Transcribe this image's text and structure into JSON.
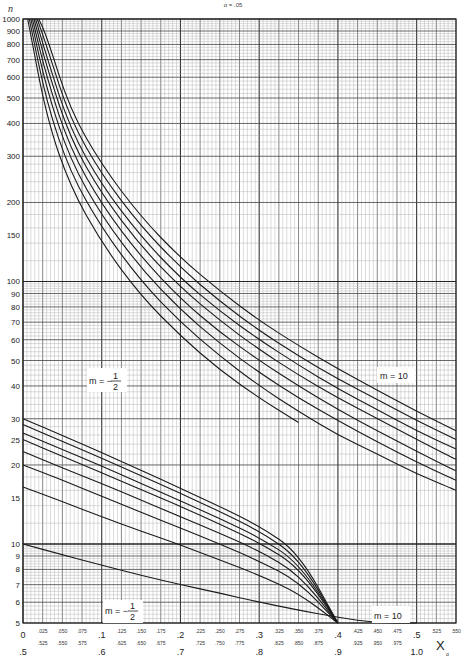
{
  "chart_data": {
    "type": "line",
    "title": "α = .05",
    "xlabel": "X_α",
    "ylabel": "n",
    "x_scale": "linear",
    "y_scale": "log",
    "xlim": [
      0,
      0.55
    ],
    "ylim": [
      5,
      1000
    ],
    "grid": true,
    "x_ticks_primary": [
      "0",
      ".025",
      ".050",
      ".075",
      ".1",
      ".125",
      ".150",
      ".175",
      ".2",
      ".225",
      ".250",
      ".275",
      ".3",
      ".325",
      ".350",
      ".375",
      ".4",
      ".425",
      ".450",
      ".475",
      ".5",
      ".525",
      ".550"
    ],
    "x_ticks_secondary": [
      ".5",
      ".525",
      ".550",
      ".575",
      ".6",
      ".625",
      ".650",
      ".675",
      ".7",
      ".725",
      ".750",
      ".775",
      ".8",
      ".825",
      ".850",
      ".875",
      ".9",
      ".925",
      ".950",
      ".975",
      "1.0"
    ],
    "y_ticks": [
      "5",
      "6",
      "7",
      "8",
      "9",
      "10",
      "15",
      "20",
      "25",
      "30",
      "40",
      "50",
      "60",
      "70",
      "80",
      "90",
      "100",
      "150",
      "200",
      "300",
      "400",
      "500",
      "600",
      "700",
      "800",
      "900",
      "1000"
    ],
    "annotations": [
      {
        "text": "m = -1/2",
        "position": "upper family, left"
      },
      {
        "text": "m = 10",
        "position": "upper family, right"
      },
      {
        "text": "m = -1/2",
        "position": "lower family, bottom-left"
      },
      {
        "text": "m = 10",
        "position": "lower family, bottom-right"
      }
    ],
    "families": [
      {
        "name": "upper (x scale 0–.55)",
        "series": [
          {
            "name": "m = -1/2",
            "x": [
              0.006,
              0.03,
              0.06,
              0.1,
              0.15,
              0.2,
              0.25,
              0.3,
              0.35
            ],
            "y": [
              1000,
              420,
              230,
              140,
              88,
              62,
              46,
              36,
              29
            ]
          },
          {
            "name": "m = 0",
            "x": [
              0.008,
              0.03,
              0.06,
              0.1,
              0.15,
              0.2,
              0.25,
              0.3,
              0.35,
              0.4,
              0.45,
              0.5,
              0.55
            ],
            "y": [
              1000,
              480,
              260,
              160,
              100,
              70,
              52,
              40,
              32,
              26,
              22,
              18.5,
              16
            ]
          },
          {
            "name": "m = 1/2",
            "x": [
              0.01,
              0.03,
              0.06,
              0.1,
              0.15,
              0.2,
              0.25,
              0.3,
              0.35,
              0.4,
              0.45,
              0.5,
              0.55
            ],
            "y": [
              1000,
              540,
              290,
              178,
              112,
              78,
              58,
              45,
              36,
              29.5,
              24.5,
              20.5,
              17.5
            ]
          },
          {
            "name": "m = 1",
            "x": [
              0.012,
              0.03,
              0.06,
              0.1,
              0.15,
              0.2,
              0.25,
              0.3,
              0.35,
              0.4,
              0.45,
              0.5,
              0.55
            ],
            "y": [
              1000,
              600,
              320,
              196,
              124,
              86,
              64,
              50,
              40,
              32.5,
              27,
              22.5,
              19
            ]
          },
          {
            "name": "m = 2",
            "x": [
              0.014,
              0.03,
              0.06,
              0.1,
              0.15,
              0.2,
              0.25,
              0.3,
              0.35,
              0.4,
              0.45,
              0.5,
              0.55
            ],
            "y": [
              1000,
              660,
              350,
              215,
              136,
              95,
              71,
              55,
              44,
              36,
              30,
              25,
              21
            ]
          },
          {
            "name": "m = 3",
            "x": [
              0.016,
              0.03,
              0.06,
              0.1,
              0.15,
              0.2,
              0.25,
              0.3,
              0.35,
              0.4,
              0.45,
              0.5,
              0.55
            ],
            "y": [
              1000,
              720,
              380,
              233,
              148,
              103,
              77,
              60,
              48,
              39,
              32.5,
              27,
              23
            ]
          },
          {
            "name": "m = 5",
            "x": [
              0.018,
              0.03,
              0.06,
              0.1,
              0.15,
              0.2,
              0.25,
              0.3,
              0.35,
              0.4,
              0.45,
              0.5,
              0.55
            ],
            "y": [
              1000,
              790,
              415,
              255,
              162,
              113,
              84,
              65,
              52,
              42.5,
              35.5,
              29.5,
              25
            ]
          },
          {
            "name": "m = 10",
            "x": [
              0.02,
              0.03,
              0.06,
              0.1,
              0.15,
              0.2,
              0.25,
              0.3,
              0.35,
              0.4,
              0.45,
              0.5,
              0.55
            ],
            "y": [
              1000,
              860,
              450,
              278,
              176,
              123,
              92,
              71,
              57,
              46.5,
              38.5,
              32,
              27
            ]
          }
        ]
      },
      {
        "name": "lower (x scale .5–1.0)",
        "series": [
          {
            "name": "m = -1/2",
            "x": [
              0.5,
              0.55,
              0.6,
              0.65,
              0.7,
              0.75,
              0.8,
              0.85,
              0.9,
              0.95,
              1.0
            ],
            "y": [
              10,
              9.1,
              8.3,
              7.6,
              7.0,
              6.5,
              6.0,
              5.6,
              5.25,
              5.0,
              5.0
            ]
          },
          {
            "name": "m = 0",
            "x": [
              0.5,
              0.55,
              0.6,
              0.65,
              0.7,
              0.75,
              0.8,
              0.85,
              0.9
            ],
            "y": [
              16.5,
              14.5,
              12.7,
              11.2,
              9.9,
              8.7,
              7.6,
              6.5,
              5.0
            ]
          },
          {
            "name": "m = 1/2",
            "x": [
              0.5,
              0.55,
              0.6,
              0.65,
              0.7,
              0.75,
              0.8,
              0.85,
              0.9
            ],
            "y": [
              20,
              17.5,
              15.2,
              13.2,
              11.5,
              10,
              8.6,
              7.2,
              5.0
            ]
          },
          {
            "name": "m = 1",
            "x": [
              0.5,
              0.55,
              0.6,
              0.65,
              0.7,
              0.75,
              0.8,
              0.85,
              0.9
            ],
            "y": [
              22.5,
              19.5,
              17,
              14.7,
              12.7,
              11,
              9.4,
              7.7,
              5.0
            ]
          },
          {
            "name": "m = 2",
            "x": [
              0.5,
              0.55,
              0.6,
              0.65,
              0.7,
              0.75,
              0.8,
              0.85,
              0.9
            ],
            "y": [
              25,
              21.6,
              18.7,
              16.1,
              13.9,
              11.9,
              10.1,
              8.2,
              5.0
            ]
          },
          {
            "name": "m = 3",
            "x": [
              0.5,
              0.55,
              0.6,
              0.65,
              0.7,
              0.75,
              0.8,
              0.85,
              0.9
            ],
            "y": [
              26.5,
              22.9,
              19.8,
              17,
              14.6,
              12.5,
              10.6,
              8.5,
              5.0
            ]
          },
          {
            "name": "m = 5",
            "x": [
              0.5,
              0.55,
              0.6,
              0.65,
              0.7,
              0.75,
              0.8,
              0.85,
              0.9
            ],
            "y": [
              28.5,
              24.6,
              21.2,
              18.2,
              15.6,
              13.3,
              11.2,
              8.9,
              5.0
            ]
          },
          {
            "name": "m = 10",
            "x": [
              0.5,
              0.55,
              0.6,
              0.65,
              0.7,
              0.75,
              0.8,
              0.85,
              0.9
            ],
            "y": [
              30,
              25.9,
              22.3,
              19.1,
              16.3,
              13.9,
              11.7,
              9.3,
              5.0
            ]
          }
        ]
      }
    ]
  },
  "labels": {
    "title": "α = .05",
    "ylabel": "n",
    "xlabel": "X",
    "xlabel_sub": "α",
    "m_upper_left": "m = −",
    "m_upper_right": "m = 10",
    "m_lower_left": "m = −",
    "m_lower_right": "m = 10",
    "frac_num": "1",
    "frac_den": "2"
  }
}
